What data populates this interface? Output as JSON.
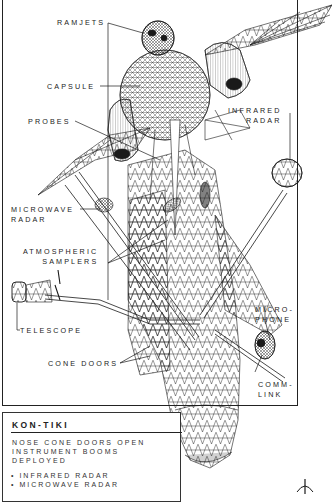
{
  "diagram": {
    "subject": "KON-TIKI",
    "style": "black wireframe line art on white",
    "colors": {
      "ink": "#1a1a1a",
      "background": "#ffffff",
      "frame": "#222222"
    }
  },
  "labels": {
    "ramjets": "RAMJETS",
    "capsule": "CAPSULE",
    "probes": "PROBES",
    "infrared_radar": "INFRARED\nRADAR",
    "microwave_radar": "MICROWAVE\nRADAR",
    "atmospheric_samplers": "ATMOSPHERIC\nSAMPLERS",
    "telescope": "TELESCOPE",
    "microphone": "MICRO-\nPHONE",
    "cone_doors": "CONE DOORS",
    "comm_link": "COMM-\nLINK"
  },
  "caption": {
    "title": "KON-TIKI",
    "description": "NOSE CONE DOORS OPEN\nINSTRUMENT BOOMS\nDEPLOYED",
    "items": [
      "INFRARED RADAR",
      "MICROWAVE RADAR"
    ]
  }
}
